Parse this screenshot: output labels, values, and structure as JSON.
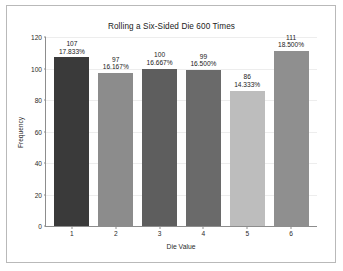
{
  "chart_data": {
    "type": "bar",
    "title": "Rolling a Six-Sided Die 600 Times",
    "xlabel": "Die Value",
    "ylabel": "Frequency",
    "categories": [
      "1",
      "2",
      "3",
      "4",
      "5",
      "6"
    ],
    "values": [
      107,
      97,
      100,
      99,
      86,
      111
    ],
    "percent_labels": [
      "17.833%",
      "16.167%",
      "16.667%",
      "16.500%",
      "14.333%",
      "18.500%"
    ],
    "count_labels": [
      "107",
      "97",
      "100",
      "99",
      "86",
      "111"
    ],
    "ylim": [
      0,
      120
    ],
    "yticks": [
      0,
      20,
      40,
      60,
      80,
      100,
      120
    ],
    "ytick_labels": [
      "0",
      "20",
      "40",
      "60",
      "80",
      "100",
      "120"
    ],
    "grid": true,
    "legend": "none",
    "bar_colors": [
      "#3a3a3a",
      "#8c8c8c",
      "#5e5e5e",
      "#6a6a6a",
      "#bdbdbd",
      "#8f8f8f"
    ],
    "total_rolls": 600
  },
  "figure": {
    "background": "#ffffff",
    "frame_color": "#b9b9b9",
    "axis_color": "#8d8d8d",
    "gridline_color": "#ededed"
  }
}
